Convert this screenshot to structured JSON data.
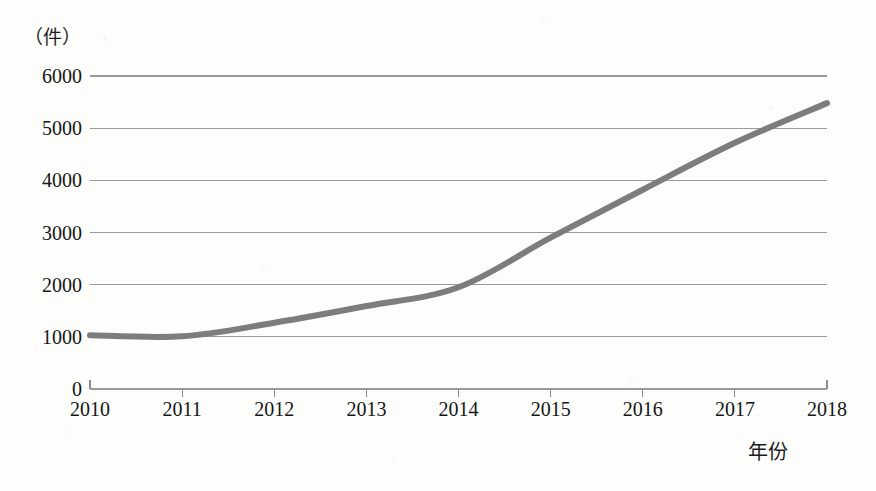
{
  "chart_data": {
    "type": "line",
    "title": "",
    "subtitle": "",
    "xlabel": "年份",
    "ylabel": "（件）",
    "unit_label": "（件）",
    "categories": [
      "2010",
      "2011",
      "2012",
      "2013",
      "2014",
      "2015",
      "2016",
      "2017",
      "2018"
    ],
    "x": [
      2010,
      2011,
      2012,
      2013,
      2014,
      2015,
      2016,
      2017,
      2018
    ],
    "values": [
      1030,
      1010,
      1270,
      1590,
      1950,
      2900,
      3820,
      4720,
      5480
    ],
    "series": [
      {
        "name": "件数",
        "values": [
          1030,
          1010,
          1270,
          1590,
          1950,
          2900,
          3820,
          4720,
          5480
        ],
        "color": "#7d7d7d"
      }
    ],
    "xlim": [
      2010,
      2018
    ],
    "ylim": [
      0,
      6000
    ],
    "y_ticks": [
      0,
      1000,
      2000,
      3000,
      4000,
      5000,
      6000
    ],
    "y_tick_labels": [
      "0",
      "1000",
      "2000",
      "3000",
      "4000",
      "5000",
      "6000"
    ],
    "x_tick_labels": [
      "2010",
      "2011",
      "2012",
      "2013",
      "2014",
      "2015",
      "2016",
      "2017",
      "2018"
    ],
    "grid": true,
    "grid_axis": "y",
    "legend": false,
    "legend_position": "none",
    "line_color": "#7d7d7d",
    "grid_color": "#9a9a9a",
    "axis_color": "#8c8c8c",
    "background_color": "#fdfdfc",
    "text_color": "#151515",
    "markers": false,
    "smoothing": true,
    "annotations": []
  },
  "axes": {
    "y_unit": "（件）",
    "x_title": "年份"
  }
}
